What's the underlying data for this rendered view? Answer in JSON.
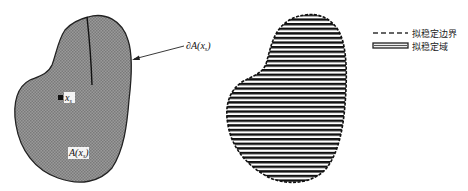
{
  "diagram": {
    "left_region": {
      "label_state_point": "x",
      "label_state_point_sub": "s",
      "label_region": "A(x",
      "label_region_sub": "s",
      "label_region_close": ")",
      "boundary_callout": "∂A(x",
      "boundary_callout_sub": "s",
      "boundary_callout_close": ")"
    },
    "legend": {
      "items": [
        {
          "label": "拟稳定边界",
          "style": "dashed-line"
        },
        {
          "label": "拟稳定域",
          "style": "hatched-bar"
        }
      ]
    },
    "colors": {
      "region_fill": "#8c8c8c",
      "outline": "#222222",
      "hatch": "#111111"
    }
  }
}
